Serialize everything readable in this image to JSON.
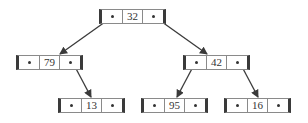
{
  "diagram": {
    "type": "binary-tree-linked-nodes",
    "node_layout": [
      "left-pointer",
      "value",
      "right-pointer"
    ],
    "nodes": {
      "n32": {
        "value": "32",
        "x": 99,
        "y": 9
      },
      "n79": {
        "value": "79",
        "x": 16,
        "y": 55
      },
      "n42": {
        "value": "42",
        "x": 183,
        "y": 55
      },
      "n13": {
        "value": "13",
        "x": 58,
        "y": 98
      },
      "n95": {
        "value": "95",
        "x": 141,
        "y": 98
      },
      "n16": {
        "value": "16",
        "x": 224,
        "y": 98
      }
    },
    "edges": [
      {
        "from": "32",
        "side": "left",
        "to": "79"
      },
      {
        "from": "32",
        "side": "right",
        "to": "42"
      },
      {
        "from": "79",
        "side": "right",
        "to": "13"
      },
      {
        "from": "42",
        "side": "left",
        "to": "95"
      },
      {
        "from": "42",
        "side": "right",
        "to": "16"
      }
    ],
    "colors": {
      "line": "#3a3a3a",
      "border": "#8a8a8a",
      "background": "#ffffff"
    }
  }
}
